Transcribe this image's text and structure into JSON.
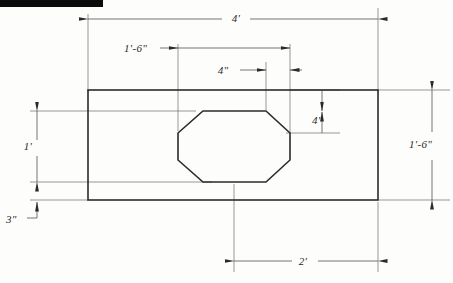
{
  "drawing": {
    "title": "Rectangular plate with octagonal opening",
    "stroke_color": "#2b2b2b",
    "dim_color": "#3a3a3a",
    "background": "#fdfdfb",
    "redaction_bar_color": "#0b0b0b"
  },
  "dimensions": {
    "overall_width": "4'",
    "left_offset_to_opening": "1'-6\"",
    "top_chamfer_horizontal": "4\"",
    "right_chamfer_vertical": "4\"",
    "opening_height": "1'",
    "bottom_edge_offset": "3\"",
    "overall_height": "1'-6\"",
    "opening_bottom_to_right_edge": "2'"
  },
  "labels": [
    {
      "id": "overall-width",
      "text": "4'",
      "x": 236,
      "y": 22
    },
    {
      "id": "left-offset",
      "text": "1'-6\"",
      "x": 124,
      "y": 52
    },
    {
      "id": "chamfer-horizontal",
      "text": "4\"",
      "x": 223,
      "y": 74
    },
    {
      "id": "chamfer-vertical",
      "text": "4\"",
      "x": 312,
      "y": 124
    },
    {
      "id": "opening-height",
      "text": "1'",
      "x": 28,
      "y": 150
    },
    {
      "id": "bottom-offset",
      "text": "3\"",
      "x": 6,
      "y": 223
    },
    {
      "id": "overall-height",
      "text": "1'-6\"",
      "x": 409,
      "y": 148
    },
    {
      "id": "bottom-width",
      "text": "2'",
      "x": 303,
      "y": 263
    }
  ],
  "geometry": {
    "plate": {
      "x1": 88,
      "y1": 90,
      "x2": 378,
      "y2": 200
    },
    "octagon_points": "178,133 203,111 266,111 290,133 290,160 266,182 203,182 178,160",
    "redaction_bar": {
      "x": 0,
      "y": 0,
      "w": 103,
      "h": 7
    }
  }
}
